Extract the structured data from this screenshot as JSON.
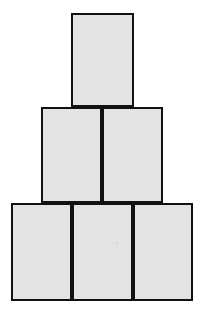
{
  "figure": {
    "background_color": "#ffffff",
    "block_fill_color": "#e3e3e3",
    "block_border_color": "#111111",
    "block_border_width_px": 2,
    "canvas": {
      "width": 215,
      "height": 318
    },
    "rows": [
      {
        "row_name": "top-row",
        "block_count": 1,
        "blocks": [
          {
            "label": "",
            "x": 71,
            "y": 13,
            "width": 63,
            "height": 94
          }
        ]
      },
      {
        "row_name": "middle-row",
        "block_count": 2,
        "blocks": [
          {
            "label": "",
            "x": 41,
            "y": 107,
            "width": 61,
            "height": 96
          },
          {
            "label": "",
            "x": 102,
            "y": 107,
            "width": 61,
            "height": 96
          }
        ]
      },
      {
        "row_name": "bottom-row",
        "block_count": 3,
        "blocks": [
          {
            "label": "",
            "x": 11,
            "y": 203,
            "width": 61,
            "height": 98
          },
          {
            "label": "",
            "x": 72,
            "y": 203,
            "width": 61,
            "height": 98
          },
          {
            "label": "",
            "x": 133,
            "y": 203,
            "width": 60,
            "height": 98
          }
        ]
      }
    ],
    "total_blocks": 6
  }
}
